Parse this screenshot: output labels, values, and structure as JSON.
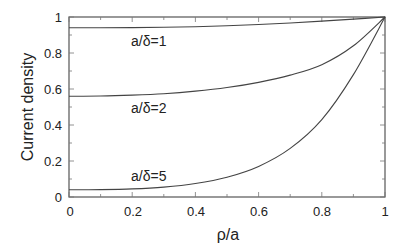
{
  "chart_data": {
    "type": "line",
    "title": "",
    "xlabel": "ρ/a",
    "ylabel": "Current density",
    "xlim": [
      0,
      1
    ],
    "ylim": [
      0,
      1
    ],
    "grid": false,
    "xticks": [
      "0",
      "0.2",
      "0.4",
      "0.6",
      "0.8",
      "1"
    ],
    "yticks": [
      "0",
      "0.2",
      "0.4",
      "0.6",
      "0.8",
      "1"
    ],
    "x": [
      0,
      0.1,
      0.2,
      0.3,
      0.4,
      0.5,
      0.6,
      0.7,
      0.8,
      0.9,
      1.0
    ],
    "series": [
      {
        "name": "a/δ=1",
        "values": [
          0.94,
          0.94,
          0.941,
          0.943,
          0.946,
          0.951,
          0.958,
          0.967,
          0.977,
          0.988,
          1.0
        ]
      },
      {
        "name": "a/δ=2",
        "values": [
          0.56,
          0.561,
          0.566,
          0.574,
          0.588,
          0.608,
          0.637,
          0.677,
          0.735,
          0.84,
          1.0
        ]
      },
      {
        "name": "a/δ=5",
        "values": [
          0.04,
          0.041,
          0.045,
          0.055,
          0.075,
          0.11,
          0.17,
          0.27,
          0.43,
          0.68,
          1.0
        ]
      }
    ],
    "annotations": [
      {
        "text": "a/δ=1",
        "x": 0.26,
        "y": 0.86
      },
      {
        "text": "a/δ=2",
        "x": 0.26,
        "y": 0.49
      },
      {
        "text": "a/δ=5",
        "x": 0.26,
        "y": 0.1
      }
    ]
  },
  "labels": {
    "xlabel": "ρ/a",
    "ylabel": "Current density",
    "curve1": "a/δ=1",
    "curve2": "a/δ=2",
    "curve3": "a/δ=5",
    "xt0": "0",
    "xt1": "0.2",
    "xt2": "0.4",
    "xt3": "0.6",
    "xt4": "0.8",
    "xt5": "1",
    "yt0": "0",
    "yt1": "0.2",
    "yt2": "0.4",
    "yt3": "0.6",
    "yt4": "0.8",
    "yt5": "1"
  }
}
